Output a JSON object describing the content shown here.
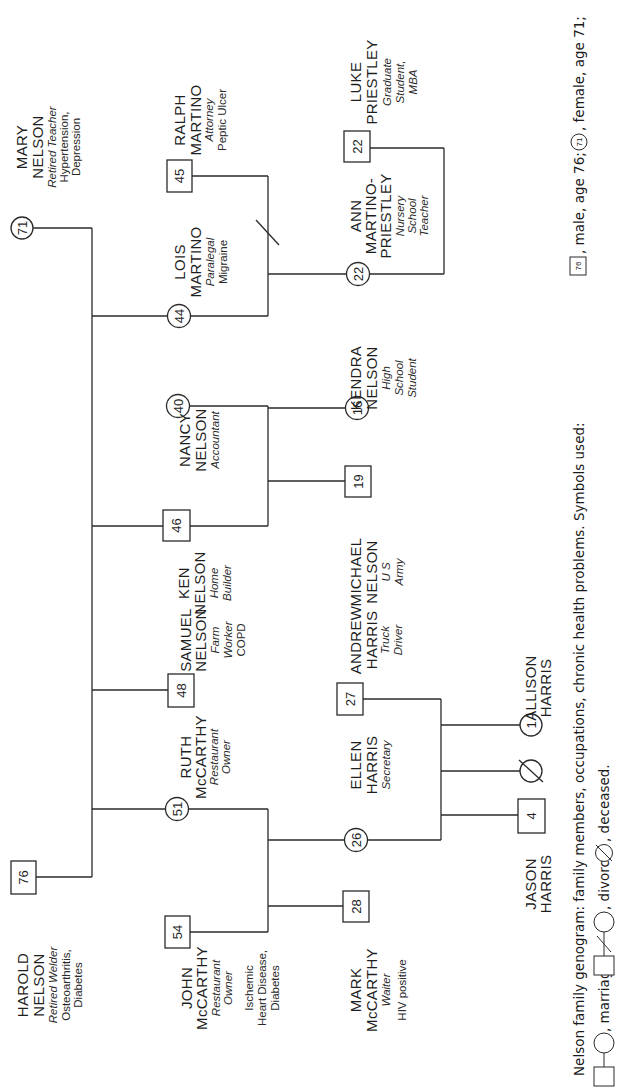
{
  "caption": {
    "line1": "Nelson family genogram: family members, occupations, chronic health problems. Symbols used:",
    "male_symbol_age": "76",
    "male_text": ", male, age 76;",
    "female_symbol_age": "71",
    "female_text": ", female, age 71;",
    "marriage_text": ", marriage;",
    "divorce_text": ", divorce;",
    "deceased_text": ", deceased."
  },
  "people": {
    "mary": {
      "age": "71",
      "sex": "female",
      "name1": "MARY",
      "name2": "NELSON",
      "occupation": "Retired Teacher",
      "health1": "Hypertension,",
      "health2": "Depression"
    },
    "harold": {
      "age": "76",
      "sex": "male",
      "name1": "HAROLD",
      "name2": "NELSON",
      "occupation": "Retired Welder",
      "health1": "Osteoarthritis,",
      "health2": "Diabetes"
    },
    "ralph": {
      "age": "45",
      "sex": "male",
      "name1": "RALPH",
      "name2": "MARTINO",
      "occupation": "Attorney",
      "health1": "Peptic Ulcer"
    },
    "lois": {
      "age": "44",
      "sex": "female",
      "name1": "LOIS",
      "name2": "MARTINO",
      "occupation": "Paralegal",
      "health1": "Migraine"
    },
    "luke": {
      "age": "22",
      "sex": "male",
      "name1": "LUKE",
      "name2": "PRIESTLEY",
      "occ1": "Graduate",
      "occ2": "Student,",
      "occ3": "MBA"
    },
    "ann": {
      "age": "22",
      "sex": "female",
      "name1": "ANN",
      "name2": "MARTINO-",
      "name3": "PRIESTLEY",
      "occ1": "Nursery",
      "occ2": "School",
      "occ3": "Teacher"
    },
    "nancy": {
      "age": "40",
      "sex": "female",
      "name1": "NANCY",
      "name2": "NELSON",
      "occupation": "Accountant"
    },
    "kendra": {
      "age": "16",
      "sex": "female",
      "name1": "KENDRA",
      "name2": "NELSON",
      "occ1": "High",
      "occ2": "School",
      "occ3": "Student"
    },
    "ken": {
      "age": "46",
      "sex": "male",
      "name1": "KEN",
      "name2": "NELSON",
      "occ1": "Home",
      "occ2": "Builder"
    },
    "michael": {
      "age": "19",
      "sex": "male",
      "name1": "MICHAEL",
      "name2": "NELSON",
      "occ1": "U S",
      "occ2": "Army"
    },
    "samuel": {
      "age": "48",
      "sex": "male",
      "name1": "SAMUEL",
      "name2": "NELSON",
      "occ1": "Farm",
      "occ2": "Worker",
      "health1": "COPD"
    },
    "andrew": {
      "age": "27",
      "sex": "male",
      "name1": "ANDREW",
      "name2": "HARRIS",
      "occ1": "Truck",
      "occ2": "Driver"
    },
    "ruth": {
      "age": "51",
      "sex": "female",
      "name1": "RUTH",
      "name2": "McCARTHY",
      "occ1": "Restaurant",
      "occ2": "Owner"
    },
    "ellen": {
      "age": "26",
      "sex": "female",
      "name1": "ELLEN",
      "name2": "HARRIS",
      "occupation": "Secretary"
    },
    "allison": {
      "age": "1",
      "sex": "female",
      "name1": "ALLISON",
      "name2": "HARRIS"
    },
    "deceased_child": {
      "sex": "female",
      "status": "deceased"
    },
    "jason": {
      "age": "4",
      "sex": "male",
      "name1": "JASON",
      "name2": "HARRIS"
    },
    "john": {
      "age": "54",
      "sex": "male",
      "name1": "JOHN",
      "name2": "McCARTHY",
      "occ1": "Restaurant",
      "occ2": "Owner",
      "health1": "Ischemic",
      "health2": "Heart Disease,",
      "health3": "Diabetes"
    },
    "mark": {
      "age": "28",
      "sex": "male",
      "name1": "MARK",
      "name2": "McCARTHY",
      "occupation": "Waiter",
      "health1": "HIV positive"
    }
  },
  "relationships": [
    {
      "type": "marriage",
      "partners": [
        "Harold Nelson",
        "Mary Nelson"
      ]
    },
    {
      "type": "divorce",
      "partners": [
        "Ralph Martino",
        "Lois Martino"
      ]
    },
    {
      "type": "marriage",
      "partners": [
        "Luke Priestley",
        "Ann Martino-Priestley"
      ]
    },
    {
      "type": "marriage",
      "partners": [
        "Ken Nelson",
        "Nancy Nelson"
      ]
    },
    {
      "type": "marriage",
      "partners": [
        "Andrew Harris",
        "Ellen Harris"
      ]
    },
    {
      "type": "marriage",
      "partners": [
        "John McCarthy",
        "Ruth McCarthy"
      ]
    }
  ]
}
